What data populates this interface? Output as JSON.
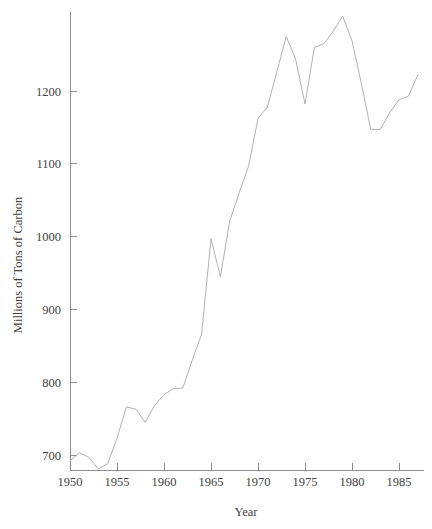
{
  "chart_data": {
    "type": "line",
    "title": "",
    "xlabel": "Year",
    "ylabel": "Millions of Tons of Carbon",
    "xlim": [
      1949.2,
      1987.4
    ],
    "ylim": [
      687,
      1312
    ],
    "grid": false,
    "legend": "none",
    "xticks": [
      1950,
      1955,
      1960,
      1965,
      1970,
      1975,
      1980,
      1985
    ],
    "xtick_labels": [
      "1950",
      "1955",
      "1960",
      "1965",
      "1970",
      "1975",
      "1980",
      "1985"
    ],
    "yticks": [
      700,
      800,
      900,
      1000,
      1100,
      1200
    ],
    "ytick_labels": [
      "700",
      "800",
      "900",
      "1000",
      "1100",
      "1200"
    ],
    "line_color": "#a8a8a8",
    "axis_color": "#8d8d8d",
    "text_color": "#3f3f3f",
    "background_color": "#ffffff",
    "x": [
      1950,
      1951,
      1952,
      1953,
      1954,
      1955,
      1956,
      1957,
      1958,
      1959,
      1960,
      1961,
      1962,
      1963,
      1964,
      1965,
      1966,
      1967,
      1968,
      1969,
      1970,
      1971,
      1972,
      1973,
      1974,
      1975,
      1976,
      1977,
      1978,
      1979,
      1980,
      1981,
      1982,
      1983,
      1984,
      1985,
      1986,
      1987
    ],
    "y": [
      692,
      703,
      697,
      681,
      688,
      723,
      766,
      763,
      745,
      768,
      783,
      791,
      792,
      830,
      866,
      997,
      945,
      1022,
      1060,
      1097,
      1162,
      1178,
      1226,
      1275,
      1244,
      1182,
      1260,
      1265,
      1282,
      1303,
      1269,
      1210,
      1147,
      1147,
      1170,
      1188,
      1193,
      1222
    ]
  },
  "axis_titles": {
    "x": "Year",
    "y": "Millions of Tons of Carbon"
  }
}
